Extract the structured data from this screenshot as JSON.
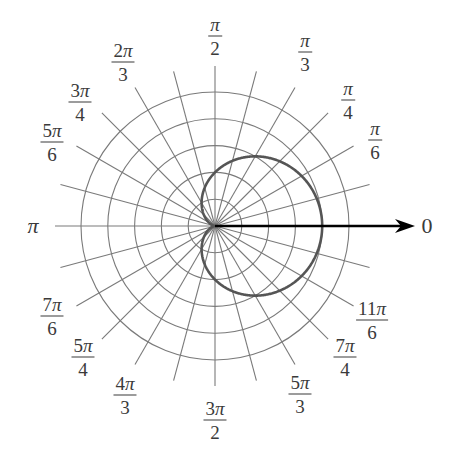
{
  "figure": {
    "center": [
      215,
      226
    ],
    "unit_px": 26.8,
    "rings": [
      1,
      2,
      3,
      4,
      5
    ],
    "ray_step_deg": 15,
    "ray_length_px": 160,
    "colors": {
      "grid": "#7a7a7a",
      "curve": "#555555",
      "axis": "#000000",
      "label": "#3a3a3a"
    },
    "polar_axis": {
      "label": "0",
      "arrow_tip_x": 415
    }
  },
  "labels": [
    {
      "id": "0",
      "num": "0",
      "den": "",
      "x": 427,
      "y": 226
    },
    {
      "id": "pi-6",
      "num": "π",
      "den": "6",
      "x": 375,
      "y": 140
    },
    {
      "id": "pi-4",
      "num": "π",
      "den": "4",
      "x": 348,
      "y": 100
    },
    {
      "id": "pi-3",
      "num": "π",
      "den": "3",
      "x": 305,
      "y": 52
    },
    {
      "id": "pi-2",
      "num": "π",
      "den": "2",
      "x": 215,
      "y": 36
    },
    {
      "id": "2pi-3",
      "num": "2π",
      "den": "3",
      "x": 123,
      "y": 62
    },
    {
      "id": "3pi-4",
      "num": "3π",
      "den": "4",
      "x": 80,
      "y": 102
    },
    {
      "id": "5pi-6",
      "num": "5π",
      "den": "6",
      "x": 52,
      "y": 142
    },
    {
      "id": "pi",
      "num": "π",
      "den": "",
      "x": 33,
      "y": 226
    },
    {
      "id": "7pi-6",
      "num": "7π",
      "den": "6",
      "x": 52,
      "y": 316
    },
    {
      "id": "5pi-4",
      "num": "5π",
      "den": "4",
      "x": 83,
      "y": 357
    },
    {
      "id": "4pi-3",
      "num": "4π",
      "den": "3",
      "x": 125,
      "y": 395
    },
    {
      "id": "3pi-2",
      "num": "3π",
      "den": "2",
      "x": 215,
      "y": 420
    },
    {
      "id": "5pi-3",
      "num": "5π",
      "den": "3",
      "x": 300,
      "y": 394
    },
    {
      "id": "7pi-4",
      "num": "7π",
      "den": "4",
      "x": 345,
      "y": 357
    },
    {
      "id": "11pi-6",
      "num": "11π",
      "den": "6",
      "x": 372,
      "y": 320
    }
  ],
  "chart_data": {
    "type": "line",
    "title": "",
    "coordinate_system": "polar",
    "equation": "r = 2 + 2cos(θ)",
    "curve_name": "cardioid",
    "r_rings": [
      1,
      2,
      3,
      4,
      5
    ],
    "rmax": 5,
    "angle_ticks": [
      "0",
      "π/6",
      "π/4",
      "π/3",
      "π/2",
      "2π/3",
      "3π/4",
      "5π/6",
      "π",
      "7π/6",
      "5π/4",
      "4π/3",
      "3π/2",
      "5π/3",
      "7π/4",
      "11π/6"
    ],
    "radial_lines_every": "π/12",
    "sample_points": [
      {
        "theta": "0",
        "r": 4
      },
      {
        "theta": "π/3",
        "r": 3
      },
      {
        "theta": "π/2",
        "r": 2
      },
      {
        "theta": "2π/3",
        "r": 1
      },
      {
        "theta": "π",
        "r": 0
      },
      {
        "theta": "4π/3",
        "r": 1
      },
      {
        "theta": "3π/2",
        "r": 2
      },
      {
        "theta": "5π/3",
        "r": 3
      }
    ],
    "grid": true,
    "legend": null
  }
}
